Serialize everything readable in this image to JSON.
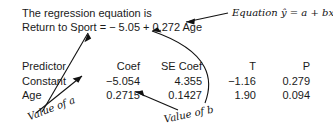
{
  "output": {
    "intro_line": "The regression equation is",
    "equation_line": "Return to Sport = − 5.05 + 0.272 Age"
  },
  "table": {
    "headers": {
      "predictor": "Predictor",
      "coef": "Coef",
      "se_coef": "SE Coef",
      "t": "T",
      "p": "P"
    },
    "rows": [
      {
        "predictor": "Constant",
        "coef": "−5.054",
        "se_coef": "4.355",
        "t": "−1.16",
        "p": "0.279"
      },
      {
        "predictor": "Age",
        "coef": "0.2715",
        "se_coef": "0.1427",
        "t": "1.90",
        "p": "0.094"
      }
    ]
  },
  "annotations": {
    "equation_callout": "Equation ŷ = a + bx",
    "value_of_a": "Value of a",
    "value_of_b": "Value of b"
  },
  "colors": {
    "background": "#ffffff",
    "text": "#1a1a1a",
    "annotation": "#111111"
  }
}
